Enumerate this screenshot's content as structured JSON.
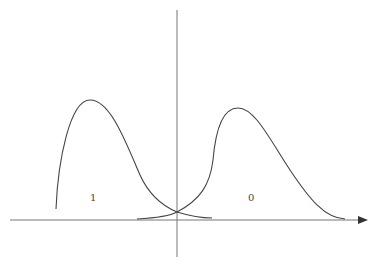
{
  "diagram": {
    "type": "two-class distribution curves",
    "labels": {
      "left_curve": "1",
      "right_curve": "0"
    },
    "colors": {
      "stroke": "#444444",
      "axis": "#666666",
      "background": "#ffffff"
    }
  }
}
